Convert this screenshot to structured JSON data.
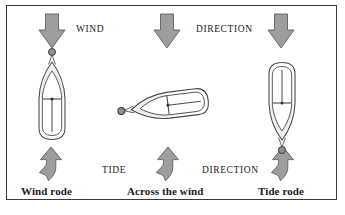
{
  "figure": {
    "background": "#ffffff",
    "border_color": "#3a3a3a"
  },
  "palette": {
    "arrow_fill": "#9d9d9d",
    "arrow_stroke": "#5f5f5f",
    "hull_stroke": "#4a4a4a",
    "hull_fill": "#ffffff",
    "deck_fill": "#ededed",
    "buoy_fill": "#8f8f8f",
    "buoy_stroke": "#3c3c3c",
    "text_color": "#1b1b1b"
  },
  "labels": {
    "wind": "WIND",
    "wind_direction": "DIRECTION",
    "tide": "TIDE",
    "tide_direction": "DIRECTION"
  },
  "captions": {
    "left": "Wind rode",
    "center": "Across the wind",
    "right": "Tide rode"
  },
  "panels": [
    {
      "key": "left",
      "caption": "Wind rode",
      "boat_heading": "bow-up",
      "buoy_position": "above-bow",
      "wind_arrow": "down",
      "tide_arrow": "up"
    },
    {
      "key": "center",
      "caption": "Across the wind",
      "boat_heading": "bow-left",
      "buoy_position": "left-of-bow",
      "wind_arrow": "down",
      "tide_arrow": "up"
    },
    {
      "key": "right",
      "caption": "Tide rode",
      "boat_heading": "bow-down",
      "buoy_position": "below-bow",
      "wind_arrow": "down",
      "tide_arrow": "up"
    }
  ],
  "icons": {
    "wind_arrow": "arrow-down-icon",
    "tide_arrow": "arrow-up-wavy-icon",
    "buoy": "mooring-buoy-icon",
    "boat": "boat-hull-icon"
  }
}
